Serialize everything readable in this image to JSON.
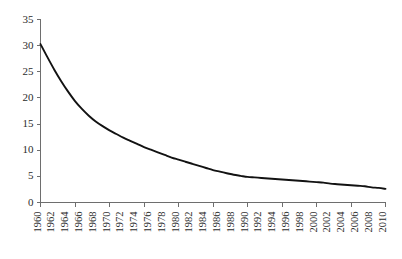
{
  "chart_data": {
    "type": "line",
    "title": "",
    "subtitle": "",
    "xlabel": "",
    "ylabel": "",
    "xlim": [
      1960,
      2010
    ],
    "ylim": [
      0,
      35
    ],
    "grid": false,
    "legend": null,
    "legend_position": "none",
    "y_ticks": [
      0,
      5,
      10,
      15,
      20,
      25,
      30,
      35
    ],
    "y_tick_labels": [
      "0",
      "5",
      "10",
      "15",
      "20",
      "25",
      "30",
      "35"
    ],
    "x_ticks": [
      1960,
      1965,
      1970,
      1975,
      1980,
      1985,
      1990,
      1995,
      2000,
      2005,
      2010
    ],
    "x_tick_labels": [
      "1960",
      "1962",
      "1964",
      "1966",
      "1968",
      "1970",
      "1972",
      "1974",
      "1976",
      "1978",
      "1980",
      "1982",
      "1984",
      "1986",
      "1988",
      "1990",
      "1992",
      "1994",
      "1996",
      "1998",
      "2000",
      "2002",
      "2004",
      "2006",
      "2008",
      "2010"
    ],
    "x_label_years": [
      1960,
      1962,
      1964,
      1966,
      1968,
      1970,
      1972,
      1974,
      1976,
      1978,
      1980,
      1982,
      1984,
      1986,
      1988,
      1990,
      1992,
      1994,
      1996,
      1998,
      2000,
      2002,
      2004,
      2006,
      2008,
      2010
    ],
    "series": [
      {
        "name": "",
        "color": "#121212",
        "x": [
          1960,
          1961,
          1962,
          1963,
          1964,
          1965,
          1966,
          1967,
          1968,
          1969,
          1970,
          1971,
          1972,
          1973,
          1974,
          1975,
          1976,
          1977,
          1978,
          1979,
          1980,
          1981,
          1982,
          1983,
          1984,
          1985,
          1986,
          1987,
          1988,
          1989,
          1990,
          1991,
          1992,
          1993,
          1994,
          1995,
          1996,
          1997,
          1998,
          1999,
          2000,
          2001,
          2002,
          2003,
          2004,
          2005,
          2006,
          2007,
          2008,
          2009,
          2010
        ],
        "values": [
          30.3,
          27.8,
          25.4,
          23.2,
          21.2,
          19.4,
          17.9,
          16.6,
          15.5,
          14.6,
          13.8,
          13.1,
          12.4,
          11.8,
          11.2,
          10.6,
          10.1,
          9.6,
          9.1,
          8.6,
          8.2,
          7.8,
          7.4,
          7.0,
          6.6,
          6.2,
          5.9,
          5.6,
          5.3,
          5.1,
          4.9,
          4.8,
          4.7,
          4.6,
          4.5,
          4.4,
          4.3,
          4.2,
          4.1,
          4.0,
          3.9,
          3.8,
          3.6,
          3.5,
          3.4,
          3.3,
          3.2,
          3.1,
          2.9,
          2.8,
          2.6
        ]
      }
    ],
    "annotations": []
  },
  "axes": {
    "y_axis_name": "y-axis",
    "x_axis_name": "x-axis"
  }
}
